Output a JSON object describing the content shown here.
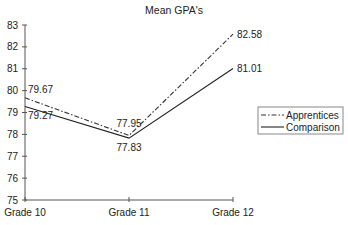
{
  "chart_data": {
    "type": "line",
    "title": "Mean GPA's",
    "xlabel": "",
    "ylabel": "",
    "categories": [
      "Grade 10",
      "Grade 11",
      "Grade 12"
    ],
    "series": [
      {
        "name": "Apprentices",
        "values": [
          79.67,
          77.95,
          82.58
        ],
        "line_style": "dash-dot",
        "color": "#333333"
      },
      {
        "name": "Comparison",
        "values": [
          79.27,
          77.83,
          81.01
        ],
        "line_style": "solid",
        "color": "#222222"
      }
    ],
    "ylim": [
      75,
      83
    ],
    "yticks": [
      75,
      76,
      77,
      78,
      79,
      80,
      81,
      82,
      83
    ],
    "grid": false,
    "legend_position": "right",
    "data_labels": true
  }
}
